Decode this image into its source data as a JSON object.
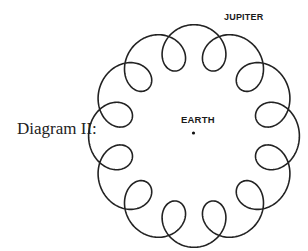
{
  "header": {
    "cropped_text": ""
  },
  "diagram": {
    "label": "Diagram II:",
    "center_body": {
      "label": "EARTH"
    },
    "orbiting_body": {
      "label": "JUPITER"
    },
    "loops": 12,
    "line_color": "#222222"
  }
}
